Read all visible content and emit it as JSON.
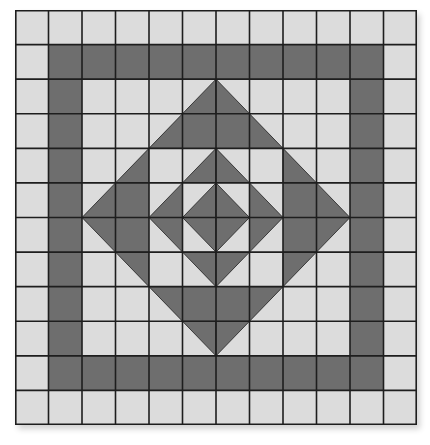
{
  "diagram": {
    "grid": {
      "cols": 12,
      "rows": 12,
      "cell_w": 33.5,
      "cell_h": 34.58
    },
    "colors": {
      "light": "#dcdcdc",
      "dark": "#6e6e6e",
      "line": "#1e1e1e"
    },
    "legend": {
      "L": "light square",
      "D": "dark square",
      "BR": "dark triangle bottom-right",
      "BL": "dark triangle bottom-left",
      "TR": "dark triangle top-right",
      "TL": "dark triangle top-left"
    },
    "cells": [
      [
        "L",
        "L",
        "L",
        "L",
        "L",
        "L",
        "L",
        "L",
        "L",
        "L",
        "L",
        "L"
      ],
      [
        "L",
        "D",
        "D",
        "D",
        "D",
        "D",
        "D",
        "D",
        "D",
        "D",
        "D",
        "L"
      ],
      [
        "L",
        "D",
        "L",
        "L",
        "L",
        "BR",
        "BL",
        "L",
        "L",
        "L",
        "D",
        "L"
      ],
      [
        "L",
        "D",
        "L",
        "L",
        "BR",
        "D",
        "D",
        "BL",
        "L",
        "L",
        "D",
        "L"
      ],
      [
        "L",
        "D",
        "L",
        "BR",
        "L",
        "BR",
        "BL",
        "L",
        "BL",
        "L",
        "D",
        "L"
      ],
      [
        "L",
        "D",
        "BR",
        "D",
        "BR",
        "BR",
        "BL",
        "BL",
        "D",
        "BL",
        "D",
        "L"
      ],
      [
        "L",
        "D",
        "TR",
        "D",
        "TR",
        "TR",
        "TL",
        "TL",
        "D",
        "TL",
        "D",
        "L"
      ],
      [
        "L",
        "D",
        "L",
        "TR",
        "L",
        "TR",
        "TL",
        "L",
        "TL",
        "L",
        "D",
        "L"
      ],
      [
        "L",
        "D",
        "L",
        "L",
        "TR",
        "D",
        "D",
        "TL",
        "L",
        "L",
        "D",
        "L"
      ],
      [
        "L",
        "D",
        "L",
        "L",
        "L",
        "TR",
        "TL",
        "L",
        "L",
        "L",
        "D",
        "L"
      ],
      [
        "L",
        "D",
        "D",
        "D",
        "D",
        "D",
        "D",
        "D",
        "D",
        "D",
        "D",
        "L"
      ],
      [
        "L",
        "L",
        "L",
        "L",
        "L",
        "L",
        "L",
        "L",
        "L",
        "L",
        "L",
        "L"
      ]
    ]
  }
}
